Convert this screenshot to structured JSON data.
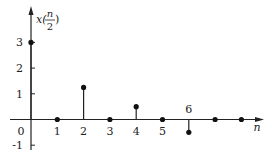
{
  "chart_data": {
    "type": "stem",
    "title": "",
    "xlabel": "n",
    "ylabel": "x(n/2)",
    "ylabel_parts": {
      "prefix": "x(",
      "num": "n",
      "den": "2",
      "suffix": ")"
    },
    "x": [
      0,
      1,
      2,
      3,
      4,
      5,
      6,
      7,
      8
    ],
    "values": [
      3,
      0,
      1.25,
      0,
      0.5,
      0,
      -0.5,
      0,
      0
    ],
    "xticks": [
      "0",
      "1",
      "2",
      "3",
      "4",
      "5",
      "6"
    ],
    "yticks": [
      "3",
      "2",
      "1",
      "-1"
    ],
    "xlim": [
      0,
      8.7
    ],
    "ylim": [
      -1.3,
      3.6
    ],
    "grid": false,
    "legend": null
  }
}
